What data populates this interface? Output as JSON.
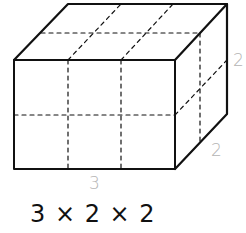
{
  "figure": {
    "type": "cuboid-unit-cubes",
    "dimensions": {
      "length": 3,
      "width": 2,
      "height": 2
    },
    "labels": {
      "length": "3",
      "depth": "2",
      "height": "2"
    },
    "formula": "3 × 2 × 2",
    "colors": {
      "edges": "#111111",
      "labels": "#b4b4b4",
      "formula": "#111111"
    }
  }
}
